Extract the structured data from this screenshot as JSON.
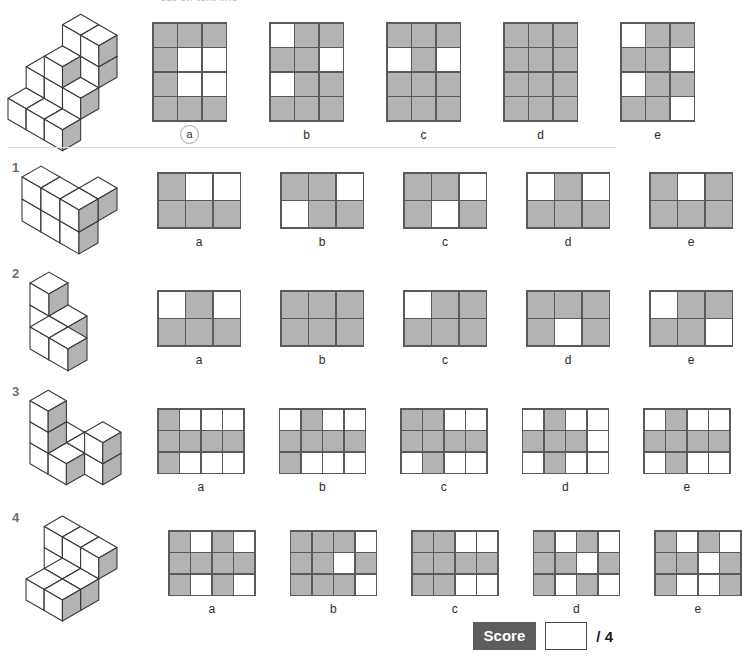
{
  "header": {
    "cutoff_text": "cut-off text line"
  },
  "score": {
    "label": "Score",
    "value": "",
    "total": "/ 4"
  },
  "colors": {
    "filled_cell": "#b3b3b3",
    "empty_cell": "#ffffff",
    "grid_line": "#5a5a5a",
    "score_badge_bg": "#5d5d5d",
    "question_number": "#6f6f6f"
  },
  "example": {
    "number": "",
    "figure_name": "isometric-cube-stack-example",
    "grid_cols": 3,
    "grid_rows": 4,
    "options": [
      {
        "label": "a",
        "selected": true,
        "cells": [
          [
            1,
            1,
            1
          ],
          [
            1,
            0,
            0
          ],
          [
            1,
            0,
            0
          ],
          [
            1,
            1,
            1
          ]
        ]
      },
      {
        "label": "b",
        "selected": false,
        "cells": [
          [
            0,
            1,
            1
          ],
          [
            1,
            1,
            0
          ],
          [
            0,
            1,
            1
          ],
          [
            1,
            1,
            1
          ]
        ]
      },
      {
        "label": "c",
        "selected": false,
        "cells": [
          [
            1,
            1,
            1
          ],
          [
            0,
            1,
            0
          ],
          [
            1,
            1,
            1
          ],
          [
            1,
            1,
            1
          ]
        ]
      },
      {
        "label": "d",
        "selected": false,
        "cells": [
          [
            1,
            1,
            1
          ],
          [
            1,
            1,
            1
          ],
          [
            1,
            1,
            1
          ],
          [
            1,
            1,
            1
          ]
        ]
      },
      {
        "label": "e",
        "selected": false,
        "cells": [
          [
            0,
            1,
            1
          ],
          [
            1,
            1,
            0
          ],
          [
            0,
            1,
            1
          ],
          [
            1,
            1,
            0
          ]
        ]
      }
    ]
  },
  "questions": [
    {
      "number": "1",
      "figure_name": "isometric-cube-stack-q1",
      "grid_cols": 3,
      "grid_rows": 2,
      "options": [
        {
          "label": "a",
          "cells": [
            [
              1,
              0,
              0
            ],
            [
              1,
              1,
              1
            ]
          ]
        },
        {
          "label": "b",
          "cells": [
            [
              1,
              1,
              0
            ],
            [
              0,
              1,
              1
            ]
          ]
        },
        {
          "label": "c",
          "cells": [
            [
              1,
              1,
              0
            ],
            [
              1,
              0,
              1
            ]
          ]
        },
        {
          "label": "d",
          "cells": [
            [
              0,
              1,
              0
            ],
            [
              1,
              1,
              1
            ]
          ]
        },
        {
          "label": "e",
          "cells": [
            [
              1,
              0,
              1
            ],
            [
              1,
              1,
              1
            ]
          ]
        }
      ]
    },
    {
      "number": "2",
      "figure_name": "isometric-cube-stack-q2",
      "grid_cols": 3,
      "grid_rows": 2,
      "options": [
        {
          "label": "a",
          "cells": [
            [
              0,
              1,
              0
            ],
            [
              1,
              1,
              1
            ]
          ]
        },
        {
          "label": "b",
          "cells": [
            [
              1,
              1,
              1
            ],
            [
              1,
              1,
              1
            ]
          ]
        },
        {
          "label": "c",
          "cells": [
            [
              0,
              1,
              1
            ],
            [
              1,
              1,
              1
            ]
          ]
        },
        {
          "label": "d",
          "cells": [
            [
              1,
              1,
              1
            ],
            [
              1,
              0,
              1
            ]
          ]
        },
        {
          "label": "e",
          "cells": [
            [
              0,
              1,
              1
            ],
            [
              1,
              1,
              0
            ]
          ]
        }
      ]
    },
    {
      "number": "3",
      "figure_name": "isometric-cube-stack-q3",
      "grid_cols": 4,
      "grid_rows": 3,
      "options": [
        {
          "label": "a",
          "cells": [
            [
              1,
              0,
              0,
              0
            ],
            [
              1,
              1,
              1,
              1
            ],
            [
              1,
              0,
              0,
              0
            ]
          ]
        },
        {
          "label": "b",
          "cells": [
            [
              0,
              1,
              0,
              0
            ],
            [
              1,
              1,
              1,
              1
            ],
            [
              1,
              0,
              0,
              0
            ]
          ]
        },
        {
          "label": "c",
          "cells": [
            [
              1,
              1,
              0,
              0
            ],
            [
              1,
              1,
              1,
              1
            ],
            [
              0,
              1,
              0,
              0
            ]
          ]
        },
        {
          "label": "d",
          "cells": [
            [
              0,
              1,
              0,
              0
            ],
            [
              1,
              1,
              1,
              0
            ],
            [
              0,
              1,
              0,
              0
            ]
          ]
        },
        {
          "label": "e",
          "cells": [
            [
              0,
              1,
              0,
              0
            ],
            [
              1,
              1,
              1,
              1
            ],
            [
              0,
              1,
              0,
              0
            ]
          ]
        }
      ]
    },
    {
      "number": "4",
      "figure_name": "isometric-cube-stack-q4",
      "grid_cols": 4,
      "grid_rows": 3,
      "options": [
        {
          "label": "a",
          "cells": [
            [
              1,
              0,
              1,
              0
            ],
            [
              1,
              1,
              1,
              1
            ],
            [
              1,
              0,
              1,
              0
            ]
          ]
        },
        {
          "label": "b",
          "cells": [
            [
              1,
              1,
              1,
              0
            ],
            [
              1,
              1,
              0,
              1
            ],
            [
              1,
              1,
              1,
              0
            ]
          ]
        },
        {
          "label": "c",
          "cells": [
            [
              1,
              1,
              0,
              0
            ],
            [
              1,
              1,
              1,
              1
            ],
            [
              1,
              1,
              0,
              0
            ]
          ]
        },
        {
          "label": "d",
          "cells": [
            [
              1,
              0,
              1,
              0
            ],
            [
              1,
              1,
              0,
              1
            ],
            [
              1,
              0,
              1,
              0
            ]
          ]
        },
        {
          "label": "e",
          "cells": [
            [
              1,
              0,
              1,
              0
            ],
            [
              1,
              1,
              0,
              1
            ],
            [
              1,
              0,
              0,
              1
            ]
          ]
        }
      ]
    }
  ]
}
